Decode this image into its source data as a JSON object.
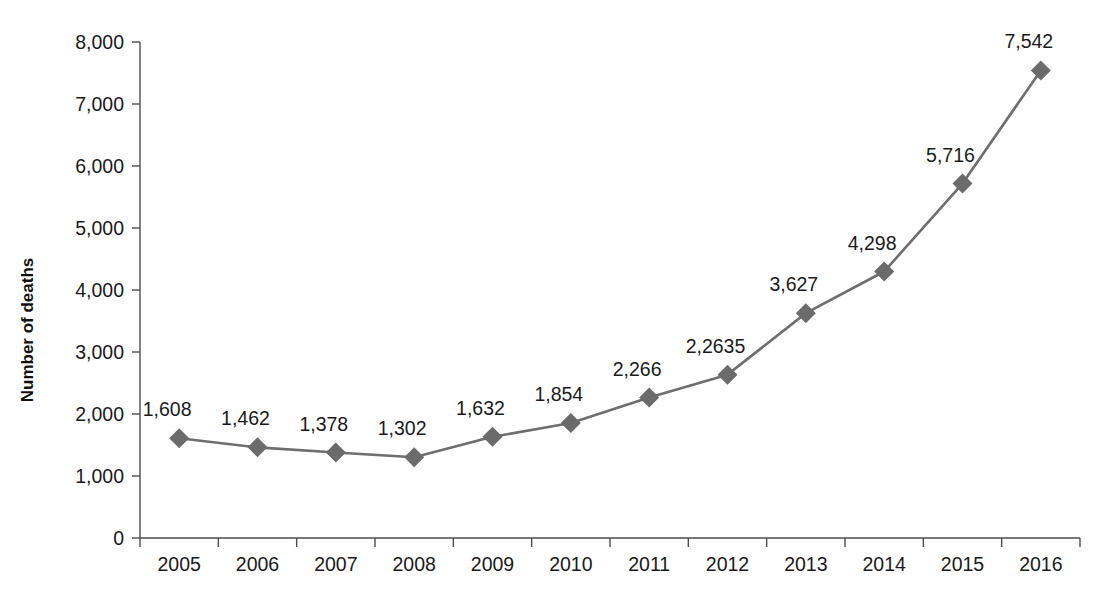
{
  "chart_data": {
    "type": "line",
    "title": "",
    "subtitle": "",
    "xlabel": "",
    "ylabel": "Number of deaths",
    "categories": [
      "2005",
      "2006",
      "2007",
      "2008",
      "2009",
      "2010",
      "2011",
      "2012",
      "2013",
      "2014",
      "2015",
      "2016"
    ],
    "values": [
      1608,
      1462,
      1378,
      1302,
      1632,
      1854,
      2266,
      2635,
      3627,
      4298,
      5716,
      7542
    ],
    "point_labels": [
      "1,608",
      "1,462",
      "1,378",
      "1,302",
      "1,632",
      "1,854",
      "2,266",
      "2,2635",
      "3,627",
      "4,298",
      "5,716",
      "7,542"
    ],
    "ylim": [
      0,
      8000
    ],
    "ytick_values": [
      0,
      1000,
      2000,
      3000,
      4000,
      5000,
      6000,
      7000,
      8000
    ],
    "ytick_labels": [
      "0",
      "1,000",
      "2,000",
      "3,000",
      "4,000",
      "5,000",
      "6,000",
      "7,000",
      "8,000"
    ],
    "grid": false,
    "legend": false,
    "legend_position": "none",
    "series_name": "Number of deaths",
    "marker_shape": "diamond",
    "colors": {
      "line": "#6e6e6e",
      "marker": "#6b6b6b",
      "axis": "#4d4d4d",
      "text": "#1a1a1a",
      "background": "#ffffff"
    }
  }
}
